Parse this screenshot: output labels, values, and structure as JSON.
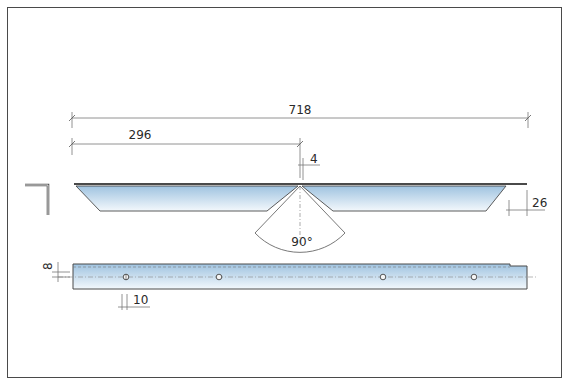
{
  "drawing": {
    "title": "Mitered angle bar — technical drawing",
    "dimensions": {
      "overall_length": "718",
      "half_length": "296",
      "notch_gap": "4",
      "end_bevel": "26",
      "miter_angle": "90°",
      "hole_offset_from_edge": "8",
      "hole_spacing_mark": "10"
    },
    "views": [
      "profile-section",
      "top-view",
      "front-view"
    ],
    "colors": {
      "fill_top": "#9fc3e0",
      "fill_bottom": "#f3f8fc",
      "line": "#4a4a4a",
      "dim_line": "#777777",
      "frame": "#4a4a4a"
    }
  }
}
